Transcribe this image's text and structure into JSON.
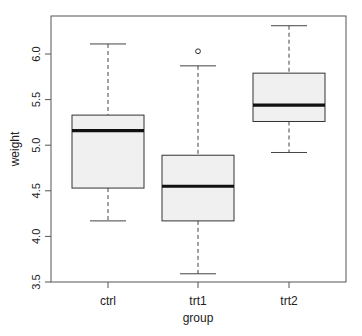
{
  "chart_data": {
    "type": "boxplot",
    "title": "",
    "xlabel": "group",
    "ylabel": "weight",
    "ylim": [
      3.5,
      6.35
    ],
    "yticks": [
      3.5,
      4.0,
      4.5,
      5.0,
      5.5,
      6.0
    ],
    "ytick_labels": [
      "3.5",
      "4.0",
      "4.5",
      "5.0",
      "5.5",
      "6.0"
    ],
    "categories": [
      "ctrl",
      "trt1",
      "trt2"
    ],
    "grid": false,
    "legend": null,
    "box_fill": "#f0f0f0",
    "series": [
      {
        "name": "ctrl",
        "whisker_low": 4.17,
        "q1": 4.53,
        "median": 5.16,
        "q3": 5.33,
        "whisker_high": 6.11,
        "outliers": []
      },
      {
        "name": "trt1",
        "whisker_low": 3.59,
        "q1": 4.17,
        "median": 4.55,
        "q3": 4.89,
        "whisker_high": 5.87,
        "outliers": [
          6.03
        ]
      },
      {
        "name": "trt2",
        "whisker_low": 4.92,
        "q1": 5.26,
        "median": 5.44,
        "q3": 5.79,
        "whisker_high": 6.31,
        "outliers": []
      }
    ]
  }
}
